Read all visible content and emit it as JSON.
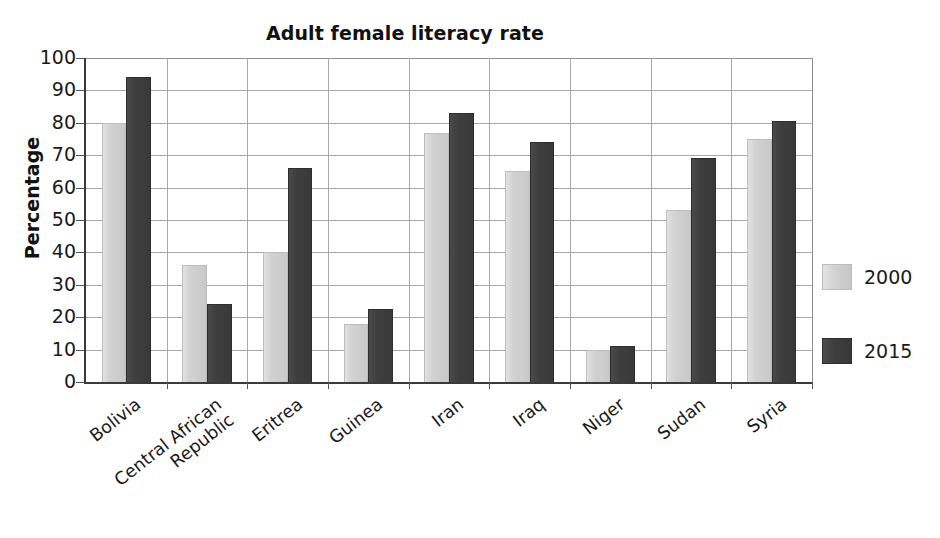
{
  "chart_data": {
    "type": "bar",
    "title": "Adult female literacy rate",
    "xlabel": "",
    "ylabel": "Percentage",
    "ylim": [
      0,
      100
    ],
    "ytick_step": 10,
    "yticks": [
      0,
      10,
      20,
      30,
      40,
      50,
      60,
      70,
      80,
      90,
      100
    ],
    "grid": "horizontal-and-vertical",
    "legend_position": "right",
    "categories": [
      "Bolivia",
      "Central African\nRepublic",
      "Eritrea",
      "Guinea",
      "Iran",
      "Iraq",
      "Niger",
      "Sudan",
      "Syria"
    ],
    "series": [
      {
        "name": "2000",
        "color": "#d2d2d2",
        "values": [
          80,
          36,
          40,
          18,
          77,
          65,
          10,
          53,
          75
        ]
      },
      {
        "name": "2015",
        "color": "#3e3e3e",
        "values": [
          94,
          24,
          66,
          22.5,
          83,
          74,
          11,
          69,
          80.5
        ]
      }
    ]
  },
  "legend": {
    "items": [
      {
        "label": "2000"
      },
      {
        "label": "2015"
      }
    ]
  }
}
